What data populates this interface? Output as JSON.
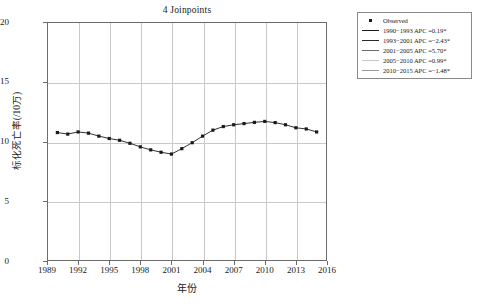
{
  "chart_data": {
    "type": "line",
    "title": "4 Joinpoints",
    "xlabel": "年份",
    "ylabel": "标化死亡率(/10万)",
    "xlim": [
      1989,
      2016
    ],
    "ylim": [
      0,
      20
    ],
    "grid": true,
    "legend_position": "right-outside",
    "x_ticks": [
      "1989",
      "1992",
      "1995",
      "1998",
      "2001",
      "2004",
      "2007",
      "2010",
      "2013",
      "2016"
    ],
    "x_tick_values": [
      1989,
      1992,
      1995,
      1998,
      2001,
      2004,
      2007,
      2010,
      2013,
      2016
    ],
    "y_ticks": [
      "0",
      "5",
      "10",
      "15",
      "20"
    ],
    "y_tick_values": [
      0,
      5,
      10,
      15,
      20
    ],
    "x": [
      1990,
      1991,
      1992,
      1993,
      1994,
      1995,
      1996,
      1997,
      1998,
      1999,
      2000,
      2001,
      2002,
      2003,
      2004,
      2005,
      2006,
      2007,
      2008,
      2009,
      2010,
      2011,
      2012,
      2013,
      2014,
      2015
    ],
    "series": [
      {
        "name": "Observed",
        "marker": "square",
        "color": "#1a1a1a",
        "values": [
          10.75,
          10.62,
          10.8,
          10.7,
          10.45,
          10.25,
          10.1,
          9.85,
          9.55,
          9.3,
          9.1,
          8.95,
          9.4,
          9.9,
          10.45,
          10.95,
          11.25,
          11.4,
          11.5,
          11.6,
          11.68,
          11.58,
          11.4,
          11.15,
          11.05,
          10.8
        ]
      }
    ],
    "annotations": []
  },
  "legend": {
    "entries": [
      {
        "key": "marker",
        "label": "Observed",
        "color": "#1a1a1a"
      },
      {
        "key": "line",
        "label": "1990−1993 APC =0.19*",
        "color": "#1a1a1a"
      },
      {
        "key": "line",
        "label": "1993−2001 APC =−2.43*",
        "color": "#2b2b2b"
      },
      {
        "key": "line",
        "label": "2001−2005 APC =5.70*",
        "color": "#6a6a6a"
      },
      {
        "key": "line",
        "label": "2005−2010 APC =0.99*",
        "color": "#c8c8c8"
      },
      {
        "key": "line",
        "label": "2010−2015 APC =−1.48*",
        "color": "#9a9a9a"
      }
    ]
  },
  "colors": {
    "axis": "#6b6b6b",
    "grid": "#c9c9c9",
    "data": "#1a1a1a",
    "background": "#ffffff"
  }
}
